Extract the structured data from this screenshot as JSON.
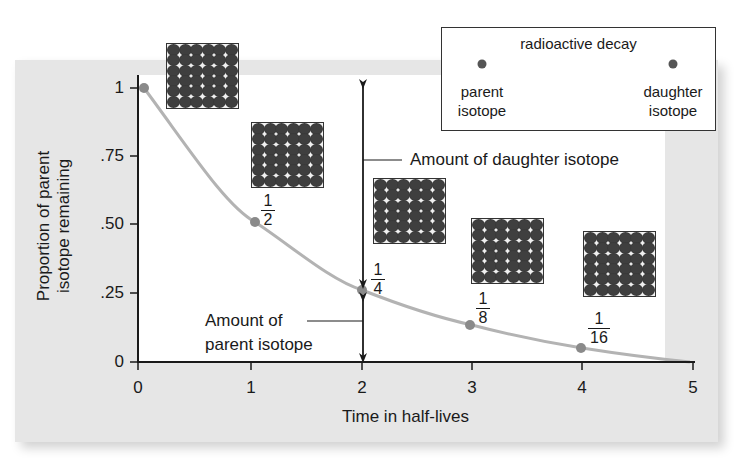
{
  "chart_data": {
    "type": "line",
    "title": "",
    "xlabel": "Time in half-lives",
    "ylabel": "Proportion of parent isotope remaining",
    "xlim": [
      0,
      5
    ],
    "ylim": [
      0,
      1
    ],
    "x_ticks": [
      "0",
      "1",
      "2",
      "3",
      "4",
      "5"
    ],
    "y_ticks": [
      "0",
      ".25",
      ".50",
      ".75",
      "1"
    ],
    "series": [
      {
        "name": "Parent isotope remaining",
        "x": [
          0,
          1,
          2,
          3,
          4,
          5
        ],
        "values": [
          1,
          0.5,
          0.25,
          0.125,
          0.0625,
          0.03125
        ],
        "marked_points": [
          0,
          1,
          2,
          3,
          4
        ],
        "point_labels": [
          "",
          "1/2",
          "1/4",
          "1/8",
          "1/16",
          ""
        ]
      }
    ],
    "annotations": [
      {
        "text": "Amount of daughter isotope",
        "x": 2,
        "range": [
          0.25,
          1
        ]
      },
      {
        "text": "Amount of parent isotope",
        "x": 2,
        "range": [
          0,
          0.25
        ]
      }
    ],
    "legend": {
      "title": "radioactive decay",
      "from": "parent isotope",
      "to": "daughter isotope",
      "position": "top-right"
    },
    "grid": false,
    "insets": [
      {
        "at_half_life": 0,
        "grid": "6x6 atoms"
      },
      {
        "at_half_life": 1,
        "grid": "6x6 atoms"
      },
      {
        "at_half_life": 2,
        "grid": "6x6 atoms"
      },
      {
        "at_half_life": 3,
        "grid": "6x6 atoms"
      },
      {
        "at_half_life": 4,
        "grid": "6x6 atoms"
      }
    ]
  },
  "axes": {
    "y_ticks": [
      {
        "label": "1",
        "y": 88
      },
      {
        "label": ".75",
        "y": 156
      },
      {
        "label": ".50",
        "y": 224
      },
      {
        "label": ".25",
        "y": 293
      },
      {
        "label": "0",
        "y": 362
      }
    ],
    "x_ticks": [
      {
        "label": "0",
        "x": 138
      },
      {
        "label": "1",
        "x": 251
      },
      {
        "label": "2",
        "x": 362
      },
      {
        "label": "3",
        "x": 472
      },
      {
        "label": "4",
        "x": 582
      },
      {
        "label": "5",
        "x": 693
      }
    ],
    "xlabel": "Time in half-lives",
    "ylabel_line1": "Proportion of parent",
    "ylabel_line2": "isotope remaining"
  },
  "fractions": [
    {
      "num": "1",
      "den": "2"
    },
    {
      "num": "1",
      "den": "4"
    },
    {
      "num": "1",
      "den": "8"
    },
    {
      "num": "1",
      "den": "16"
    }
  ],
  "annotations": {
    "daughter": "Amount of daughter isotope",
    "parent_line1": "Amount of",
    "parent_line2": "parent isotope"
  },
  "legend": {
    "title": "radioactive decay",
    "parent_line1": "parent",
    "parent_line2": "isotope",
    "daughter_line1": "daughter",
    "daughter_line2": "isotope"
  },
  "colors": {
    "panel": "#e6e6e6",
    "curve": "#b3b3b3",
    "point": "#8a8a8a",
    "axis": "#1a1a1a",
    "atom": "#3f3f3f"
  }
}
